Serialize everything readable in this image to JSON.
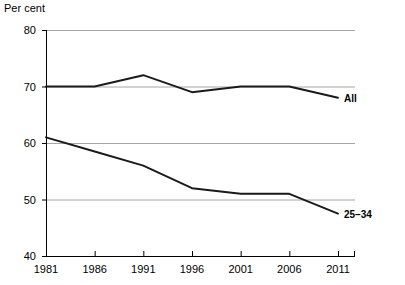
{
  "chart_data": {
    "type": "line",
    "title": "",
    "subtitle": "",
    "ylabel": "Per cent",
    "xlabel": "",
    "x": [
      1981,
      1986,
      1991,
      1996,
      2001,
      2006,
      2011
    ],
    "xtick_labels": [
      "1981",
      "1986",
      "1991",
      "1996",
      "2001",
      "2006",
      "2011"
    ],
    "ytick_labels": [
      "40",
      "50",
      "60",
      "70",
      "80"
    ],
    "yticks": [
      40,
      50,
      60,
      70,
      80
    ],
    "ylim": [
      40,
      80
    ],
    "xlim": [
      1981,
      2011
    ],
    "grid": "horizontal",
    "legend_position": "line-end-labels",
    "series": [
      {
        "name": "All",
        "label": "All",
        "color": "#1a1a1a",
        "values": [
          70,
          70,
          72,
          69,
          70,
          70,
          68
        ]
      },
      {
        "name": "25–34",
        "label": "25–34",
        "color": "#1a1a1a",
        "values": [
          61,
          58.5,
          56,
          52,
          51,
          51,
          47.5
        ]
      }
    ],
    "colors": {
      "line": "#1a1a1a",
      "grid": "#a6a6a6",
      "axis": "#000000",
      "background": "#ffffff"
    }
  }
}
